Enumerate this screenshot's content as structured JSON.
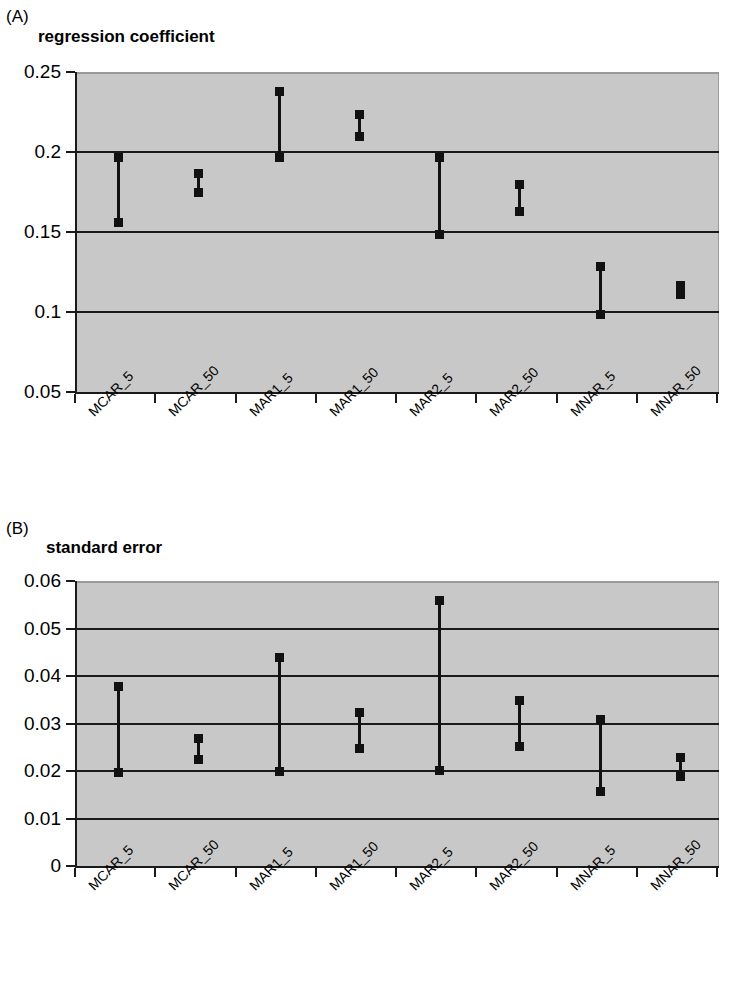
{
  "figure": {
    "panels": [
      {
        "letter": "(A)",
        "title": "regression coefficient"
      },
      {
        "letter": "(B)",
        "title": "standard error"
      }
    ]
  },
  "chart_data": [
    {
      "type": "line",
      "panel": "(A)",
      "title": "regression coefficient",
      "xlabel": "",
      "ylabel": "",
      "ylim": [
        0.05,
        0.25
      ],
      "yticks": [
        "0.05",
        "0.1",
        "0.15",
        "0.2",
        "0.25"
      ],
      "ytick_values": [
        0.05,
        0.1,
        0.15,
        0.2,
        0.25
      ],
      "grid": true,
      "legend": "none",
      "categories": [
        "MCAR_5",
        "MCAR_50",
        "MAR1_5",
        "MAR1_50",
        "MAR2_5",
        "MAR2_50",
        "MNAR_5",
        "MNAR_50"
      ],
      "series": [
        {
          "name": "upper",
          "values": [
            0.197,
            0.187,
            0.238,
            0.224,
            0.197,
            0.18,
            0.129,
            0.117
          ]
        },
        {
          "name": "lower",
          "values": [
            0.156,
            0.175,
            0.197,
            0.21,
            0.149,
            0.163,
            0.099,
            0.111
          ]
        }
      ]
    },
    {
      "type": "line",
      "panel": "(B)",
      "title": "standard error",
      "xlabel": "",
      "ylabel": "",
      "ylim": [
        0,
        0.06
      ],
      "yticks": [
        "0",
        "0.01",
        "0.02",
        "0.03",
        "0.04",
        "0.05",
        "0.06"
      ],
      "ytick_values": [
        0,
        0.01,
        0.02,
        0.03,
        0.04,
        0.05,
        0.06
      ],
      "grid": true,
      "legend": "none",
      "categories": [
        "MCAR_5",
        "MCAR_50",
        "MAR1_5",
        "MAR1_50",
        "MAR2_5",
        "MAR2_50",
        "MNAR_5",
        "MNAR_50"
      ],
      "series": [
        {
          "name": "upper",
          "values": [
            0.038,
            0.027,
            0.044,
            0.0325,
            0.056,
            0.035,
            0.031,
            0.023
          ]
        },
        {
          "name": "lower",
          "values": [
            0.0198,
            0.0225,
            0.0201,
            0.0248,
            0.0203,
            0.0252,
            0.0158,
            0.019
          ]
        }
      ]
    }
  ]
}
